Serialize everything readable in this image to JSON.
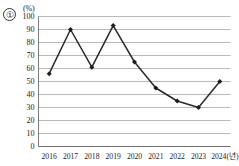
{
  "figure": {
    "item_number": "①",
    "unit_label": "(%)"
  },
  "chart_data": {
    "type": "line",
    "title": "",
    "subtitle": "",
    "xlabel": "연도",
    "ylabel": "(%)",
    "categories": [
      "2016",
      "2017",
      "2018",
      "2019",
      "2020",
      "2021",
      "2022",
      "2023",
      "2024(년)"
    ],
    "x_tick_labels": [
      "2016",
      "2017",
      "2018",
      "2019",
      "2020",
      "2021",
      "2022",
      "2023",
      "2024(년)"
    ],
    "values": [
      56,
      90,
      61,
      93,
      65,
      45,
      35,
      30,
      50
    ],
    "series": [
      {
        "name": "",
        "values": [
          56,
          90,
          61,
          93,
          65,
          45,
          35,
          30,
          50
        ]
      }
    ],
    "y_tick_labels": [
      "0",
      "10",
      "20",
      "30",
      "40",
      "50",
      "60",
      "70",
      "80",
      "90",
      "100"
    ],
    "y_ticks": [
      0,
      10,
      20,
      30,
      40,
      50,
      60,
      70,
      80,
      90,
      100
    ],
    "ylim": [
      0,
      100
    ],
    "grid": "horizontal",
    "legend": "none",
    "marker": "filled-diamond",
    "line_color": "#2b2b2b",
    "grid_color": "#8a8a8a",
    "annotations": []
  }
}
